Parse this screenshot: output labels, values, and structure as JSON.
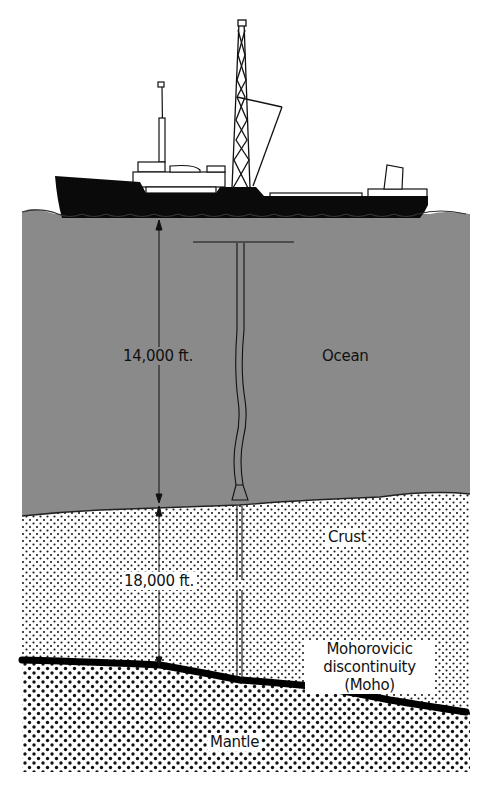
{
  "diagram": {
    "type": "cross-section",
    "colors": {
      "ocean": "#8a8a8a",
      "ship": "#0a0a0a",
      "crust_bg": "#ffffff",
      "dots": "#1a1a1a",
      "moho_line": "#000000",
      "text": "#111111"
    },
    "layers": [
      {
        "id": "ocean",
        "label": "Ocean"
      },
      {
        "id": "crust",
        "label": "Crust"
      },
      {
        "id": "moho",
        "label_lines": [
          "Mohorovicic",
          "discontinuity",
          "(Moho)"
        ]
      },
      {
        "id": "mantle",
        "label": "Mantle"
      }
    ],
    "measurements": {
      "ocean_depth": "14,000 ft.",
      "crust_thickness": "18,000 ft."
    }
  }
}
